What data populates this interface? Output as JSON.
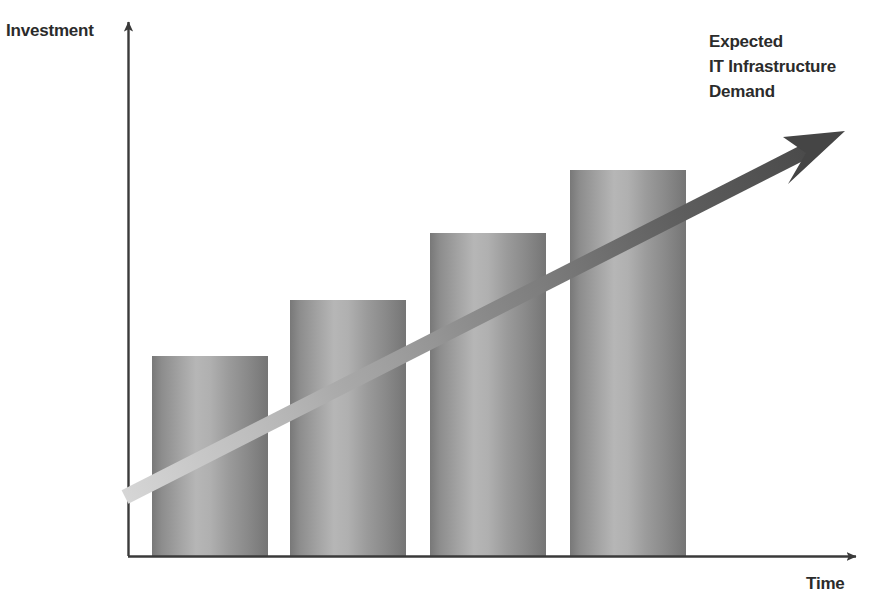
{
  "chart_data": {
    "type": "bar",
    "title": "",
    "subtitle": "",
    "xlabel": "Time",
    "ylabel": "Investment",
    "categories": [
      "1",
      "2",
      "3",
      "4"
    ],
    "values": [
      200,
      256,
      323,
      386
    ],
    "value_unit": "relative bar height (px)",
    "ylim": [
      0,
      542
    ],
    "xlim": [
      0,
      738
    ],
    "grid": false,
    "legend": null,
    "legend_position": "none",
    "axis_style": "arrow-ended, no tick labels, no gridlines",
    "bar_style": "3D cylindrical gray gradient",
    "annotations": [
      {
        "name": "trend-arrow-label",
        "lines": [
          "Expected",
          "IT Infrastructure",
          "Demand"
        ],
        "text": "Expected IT Infrastructure Demand"
      }
    ],
    "series": [
      {
        "name": "Investment",
        "values": [
          200,
          256,
          323,
          386
        ]
      }
    ],
    "trend": {
      "name": "Expected IT Infrastructure Demand",
      "direction": "increasing",
      "start": [
        125,
        497
      ],
      "end": [
        842,
        133
      ]
    }
  },
  "axes": {
    "y_title": "Investment",
    "x_title": "Time"
  },
  "annotation": {
    "line1": "Expected",
    "line2": "IT Infrastructure",
    "line3": "Demand"
  },
  "colors": {
    "background": "#ffffff",
    "axis": "#3a3a3a",
    "text": "#2b2b2b",
    "bar_edge": "#787878",
    "bar_center": "#b6b6b6",
    "arrow_tail": "#cfcfcf",
    "arrow_head": "#4a4a4a"
  },
  "bar_geometry": [
    {
      "name": "bar-1",
      "x": 152,
      "y": 356,
      "width": 116,
      "height": 200
    },
    {
      "name": "bar-2",
      "x": 290,
      "y": 300,
      "width": 116,
      "height": 256
    },
    {
      "name": "bar-3",
      "x": 430,
      "y": 233,
      "width": 116,
      "height": 323
    },
    {
      "name": "bar-4",
      "x": 570,
      "y": 170,
      "width": 116,
      "height": 386
    }
  ]
}
